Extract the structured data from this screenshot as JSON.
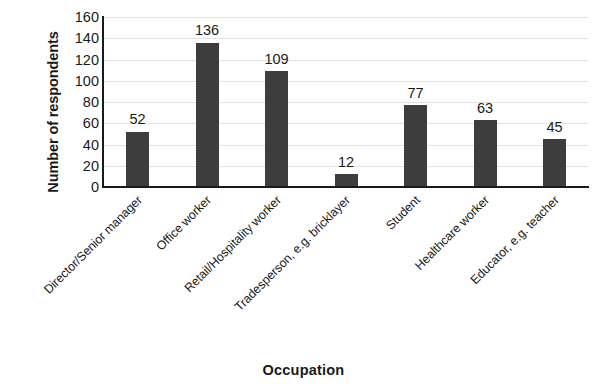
{
  "chart_data": {
    "type": "bar",
    "title": "",
    "xlabel": "Occupation",
    "ylabel": "Number of respondents",
    "categories": [
      "Director/Senior manager",
      "Office worker",
      "Retail/Hospitality worker",
      "Tradesperson, e.g. bricklayer",
      "Student",
      "Healthcare worker",
      "Educator, e.g. teacher"
    ],
    "values": [
      52,
      136,
      109,
      12,
      77,
      63,
      45
    ],
    "value_labels": [
      "52",
      "136",
      "109",
      "12",
      "77",
      "63",
      "45"
    ],
    "ylim": [
      0,
      160
    ],
    "ytick_step": 20,
    "ytick_labels": [
      "160",
      "140",
      "120",
      "100",
      "80",
      "60",
      "40",
      "20",
      "0"
    ],
    "ytick_values": [
      160,
      140,
      120,
      100,
      80,
      60,
      40,
      20,
      0
    ],
    "grid": "horizontal",
    "legend": "none",
    "bar_color": "#3d3d3d",
    "gridline_color": "#e2e2e2",
    "axis_color": "#1a1a1a",
    "background_color": "#ffffff",
    "label_rotation_deg": -45
  }
}
